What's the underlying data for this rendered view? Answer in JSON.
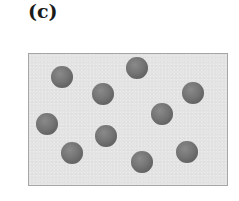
{
  "figure": {
    "panel_label": "(c)",
    "container": {
      "left": 28,
      "top": 53,
      "width": 200,
      "height": 133,
      "fill_color": "#e4e4e4",
      "border_color": "#a6a6a6"
    },
    "particle_color": "#6e6e6e",
    "particle_radius": 11,
    "particle_count": 10,
    "particles": [
      {
        "cx": 62,
        "cy": 77
      },
      {
        "cx": 137,
        "cy": 68
      },
      {
        "cx": 103,
        "cy": 94
      },
      {
        "cx": 193,
        "cy": 93
      },
      {
        "cx": 162,
        "cy": 114
      },
      {
        "cx": 47,
        "cy": 124
      },
      {
        "cx": 106,
        "cy": 136
      },
      {
        "cx": 72,
        "cy": 153
      },
      {
        "cx": 142,
        "cy": 162
      },
      {
        "cx": 187,
        "cy": 152
      }
    ]
  }
}
